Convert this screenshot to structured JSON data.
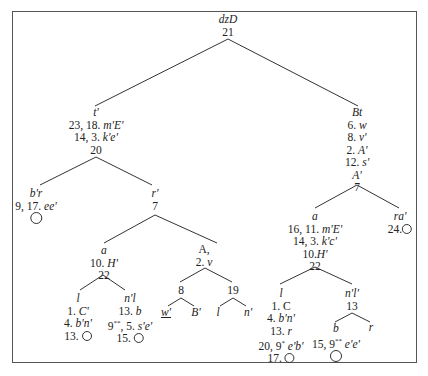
{
  "tree": {
    "root": {
      "lines": [
        "dzD",
        "21"
      ]
    },
    "left": {
      "lines": [
        "t'",
        "23, 18. m'E'",
        "14, 3. k'e'",
        "20"
      ]
    },
    "left_left": {
      "lines": [
        "b'r",
        "9, 17. ee'"
      ]
    },
    "left_right": {
      "lines": [
        "r'",
        "7"
      ]
    },
    "lr_a": {
      "lines": [
        "a",
        "10. H'",
        "22"
      ]
    },
    "lr_a_l": {
      "lines": [
        "l",
        "1. C'",
        "4. b'n'",
        "13."
      ]
    },
    "lr_a_nl": {
      "lines": [
        "n'l",
        "13. b",
        "9**, 5. s'e'",
        "15."
      ]
    },
    "lr_A": {
      "lines": [
        "A,",
        "2. v"
      ]
    },
    "lr_A_8": {
      "label": "8"
    },
    "lr_A_8_children": [
      "w'",
      "B'"
    ],
    "lr_A_19": {
      "label": "19"
    },
    "lr_A_19_children": [
      "l",
      "n'"
    ],
    "right": {
      "lines": [
        "Bt",
        "6. w",
        "8. v'",
        "2. A'",
        "12. s'",
        "A'",
        "7"
      ]
    },
    "right_a": {
      "lines": [
        "a",
        "16, 11. m'E'",
        "14, 3. k'c'",
        "10.H'",
        "22"
      ]
    },
    "right_ra": {
      "lines": [
        "ra'",
        "24."
      ]
    },
    "ra_l": {
      "lines": [
        "l",
        "1. C",
        "4. b'n'",
        "13. r",
        "20, 9* e'b'",
        "17."
      ]
    },
    "ra_nl": {
      "lines": [
        "n'l'",
        "13"
      ]
    },
    "ra_nl_b": {
      "lines": [
        "b",
        "15, 9** e'e'"
      ]
    },
    "ra_nl_r": {
      "label": "r"
    }
  }
}
